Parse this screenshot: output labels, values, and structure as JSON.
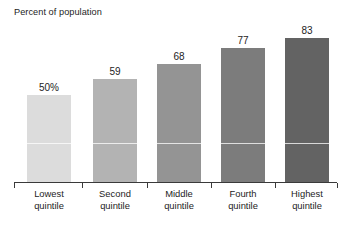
{
  "chart_data": {
    "type": "bar",
    "title": "Percent of population",
    "xlabel": "",
    "ylabel": "Percent of population",
    "ylim": [
      0,
      100
    ],
    "grid": false,
    "legend": "none",
    "categories": [
      "Lowest quintile",
      "Second quintile",
      "Middle quintile",
      "Fourth quintile",
      "Highest quintile"
    ],
    "category_lines": [
      [
        "Lowest",
        "quintile"
      ],
      [
        "Second",
        "quintile"
      ],
      [
        "Middle",
        "quintile"
      ],
      [
        "Fourth",
        "quintile"
      ],
      [
        "Highest",
        "quintile"
      ]
    ],
    "values": [
      50,
      59,
      68,
      77,
      83
    ],
    "value_labels": [
      "50%",
      "59",
      "68",
      "77",
      "83"
    ],
    "bar_colors": [
      "#dcdcdc",
      "#b3b3b3",
      "#949494",
      "#7c7c7c",
      "#636363"
    ],
    "text_color": "#1d1d1d",
    "axis_color": "#3a3a3a"
  },
  "bars": [
    {
      "label_line1": "Lowest",
      "label_line2": "quintile",
      "value_label": "50%"
    },
    {
      "label_line1": "Second",
      "label_line2": "quintile",
      "value_label": "59"
    },
    {
      "label_line1": "Middle",
      "label_line2": "quintile",
      "value_label": "68"
    },
    {
      "label_line1": "Fourth",
      "label_line2": "quintile",
      "value_label": "77"
    },
    {
      "label_line1": "Highest",
      "label_line2": "quintile",
      "value_label": "83"
    }
  ]
}
